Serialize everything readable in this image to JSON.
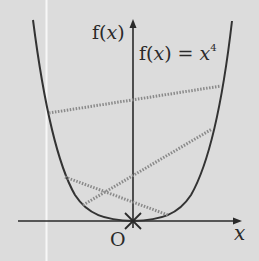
{
  "figure": {
    "background": "#dcdcdc",
    "curve_color": "#333333",
    "chord_color": "#8a8a8a",
    "y_axis_label": "f(x)",
    "function_label_lhs": "f(x) = ",
    "function_label_base": "x",
    "function_label_exp": "4",
    "x_axis_label": "x",
    "origin_label": "O",
    "chords": [
      {
        "name": "upper-chord",
        "from": [
          49,
          113
        ],
        "to": [
          221,
          86
        ]
      },
      {
        "name": "rising-chord",
        "from": [
          83,
          205
        ],
        "to": [
          212,
          129
        ]
      },
      {
        "name": "descending-chord",
        "from": [
          65,
          177
        ],
        "to": [
          168,
          215
        ]
      }
    ]
  }
}
